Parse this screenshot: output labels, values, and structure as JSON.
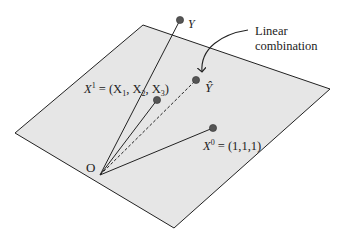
{
  "diagram": {
    "title": "",
    "plane_color": "#e6e6e6",
    "line_color": "#222222",
    "point_color": "#555555",
    "origin": {
      "label": "O"
    },
    "vectors": [
      {
        "id": "Y",
        "label": "Y",
        "style": "solid"
      },
      {
        "id": "X1",
        "label_main": "X",
        "label_sup": "1",
        "label_rest": " = (X",
        "sub1": "1",
        "comma1": ", X",
        "sub2": "2",
        "comma2": ", X",
        "sub3": "3",
        "close": ")",
        "style": "solid"
      },
      {
        "id": "Yhat",
        "label": "Ŷ",
        "style": "dashed"
      },
      {
        "id": "X0",
        "label_main": "X",
        "label_sup": "0",
        "label_rest": " = (1,1,1)",
        "style": "solid"
      }
    ],
    "annotation": {
      "line1": "Linear",
      "line2": "combination"
    }
  }
}
